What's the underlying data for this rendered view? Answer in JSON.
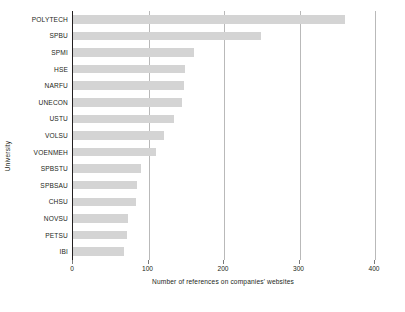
{
  "chart_data": {
    "type": "bar",
    "orientation": "horizontal",
    "title": "",
    "xlabel": "Number of references on companies' websites",
    "ylabel": "University",
    "categories": [
      "POLYTECH",
      "SPBU",
      "SPMI",
      "HSE",
      "NARFU",
      "UNECON",
      "USTU",
      "VOLSU",
      "VOENMEH",
      "SPBSTU",
      "SPBSAU",
      "CHSU",
      "NOVSU",
      "PETSU",
      "IBI"
    ],
    "values": [
      360,
      249,
      160,
      148,
      147,
      145,
      134,
      120,
      110,
      90,
      85,
      84,
      73,
      72,
      68
    ],
    "xlim": [
      0,
      400
    ],
    "xticks": [
      0,
      100,
      200,
      300,
      400
    ],
    "xticklabels": [
      "0",
      "100",
      "200",
      "300",
      "400"
    ],
    "grid": "vertical-only",
    "legend": "none",
    "bar_color": "#d4d4d4",
    "gridline_color": "#b9b9b9",
    "axis_color": "#231f20",
    "background": "#ffffff"
  }
}
